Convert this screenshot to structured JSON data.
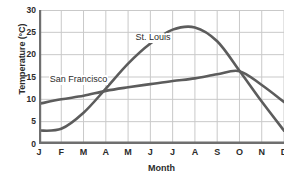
{
  "chart_data": {
    "type": "line",
    "title": "",
    "xlabel": "Month",
    "ylabel": "Temperature (°C)",
    "categories": [
      "J",
      "F",
      "M",
      "A",
      "M",
      "J",
      "J",
      "A",
      "S",
      "O",
      "N",
      "D"
    ],
    "xlim": [
      0,
      11
    ],
    "ylim": [
      0,
      30
    ],
    "yticks": [
      0,
      5,
      10,
      15,
      20,
      25,
      30
    ],
    "grid": true,
    "legend_position": "inline-annotation",
    "series": [
      {
        "name": "St. Louis",
        "color": "#5c5c5c",
        "values": [
          3,
          3.4,
          7,
          12.4,
          18,
          22.5,
          25.6,
          26.1,
          23,
          16.4,
          9.5,
          3
        ]
      },
      {
        "name": "San Francisco",
        "color": "#5c5c5c",
        "values": [
          9,
          10,
          10.8,
          11.9,
          12.7,
          13.4,
          14.1,
          14.7,
          15.6,
          16.3,
          13.2,
          9.4
        ]
      }
    ],
    "annotations": [
      {
        "text": "St. Louis",
        "x": 4.2,
        "y": 23.4
      },
      {
        "text": "San Francisco",
        "x": 0.35,
        "y": 14.0
      }
    ]
  },
  "style": {
    "axis_color": "#7a7a7a",
    "grid_color": "#c9c9c9",
    "text_color": "#2b2b2b",
    "background": "#ffffff"
  }
}
